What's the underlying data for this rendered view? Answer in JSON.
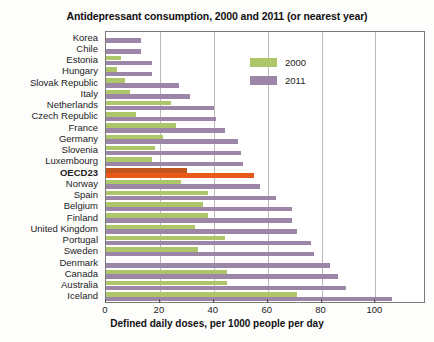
{
  "chart_data": {
    "type": "bar",
    "orientation": "horizontal",
    "title": "Antidepressant consumption, 2000 and 2011 (or nearest year)",
    "xlabel": "Defined daily doses, per 1000 people per day",
    "ylabel": "",
    "xlim": [
      0,
      118
    ],
    "xticks": [
      0,
      20,
      40,
      60,
      80,
      100
    ],
    "grid": true,
    "legend_position": "upper right",
    "categories": [
      "Korea",
      "Chile",
      "Estonia",
      "Hungary",
      "Slovak Republic",
      "Italy",
      "Netherlands",
      "Czech Republic",
      "France",
      "Germany",
      "Slovenia",
      "Luxembourg",
      "OECD23",
      "Norway",
      "Spain",
      "Belgium",
      "Finland",
      "United Kingdom",
      "Portugal",
      "Sweden",
      "Denmark",
      "Canada",
      "Australia",
      "Iceland"
    ],
    "highlight_category": "OECD23",
    "series": [
      {
        "name": "2000",
        "color": "#aec66a",
        "highlight_color": "#c2551c",
        "values": [
          0,
          0,
          5.5,
          4,
          7,
          9,
          24,
          11,
          26,
          21,
          18,
          17,
          30,
          28,
          38,
          36,
          38,
          33,
          44,
          34,
          0,
          45,
          45,
          71
        ]
      },
      {
        "name": "2011",
        "color": "#9b86a8",
        "highlight_color": "#e8591a",
        "values": [
          13,
          13,
          17,
          17,
          27,
          31,
          40,
          41,
          44,
          49,
          50,
          51,
          55,
          57,
          63,
          69,
          69,
          71,
          76,
          77,
          83,
          86,
          89,
          106
        ]
      }
    ]
  },
  "legend": {
    "items": [
      {
        "label": "2000",
        "color": "#aec66a"
      },
      {
        "label": "2011",
        "color": "#9b86a8"
      }
    ]
  }
}
